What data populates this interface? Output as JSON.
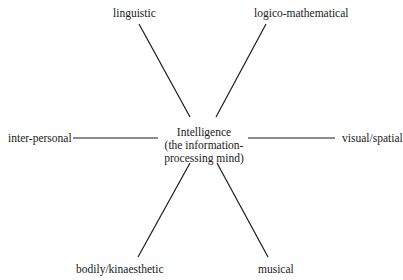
{
  "diagram": {
    "type": "radial",
    "center": {
      "line1": "Intelligence",
      "line2": "(the information-",
      "line3": "processing mind)"
    },
    "nodes": [
      {
        "id": "linguistic",
        "label": "linguistic"
      },
      {
        "id": "logico-mathematical",
        "label": "logico-mathematical"
      },
      {
        "id": "inter-personal",
        "label": "inter-personal"
      },
      {
        "id": "visual-spatial",
        "label": "visual/spatial"
      },
      {
        "id": "bodily-kinaesthetic",
        "label": "bodily/kinaesthetic"
      },
      {
        "id": "musical",
        "label": "musical"
      }
    ],
    "edges": [
      {
        "from": "center",
        "to": "linguistic"
      },
      {
        "from": "center",
        "to": "logico-mathematical"
      },
      {
        "from": "center",
        "to": "inter-personal"
      },
      {
        "from": "center",
        "to": "visual-spatial"
      },
      {
        "from": "center",
        "to": "bodily-kinaesthetic"
      },
      {
        "from": "center",
        "to": "musical"
      }
    ],
    "line_color": "#1a1a1a"
  }
}
